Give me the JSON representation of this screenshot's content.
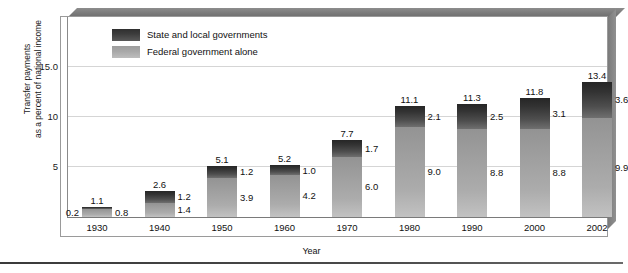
{
  "chart_data": {
    "type": "bar",
    "subtype": "stacked-bar",
    "title": "",
    "xlabel": "Year",
    "ylabel": "Transfer payments as a percent of national income",
    "ylabel_line1": "Transfer payments",
    "ylabel_line2": "as a percent of national income",
    "ylim": [
      0,
      17
    ],
    "yticks": [
      "5",
      "10",
      "15.0"
    ],
    "ytick_values": [
      5,
      10,
      15
    ],
    "grid": true,
    "legend_position": "top-left-inside",
    "categories": [
      "1930",
      "1940",
      "1950",
      "1960",
      "1970",
      "1980",
      "1990",
      "2000",
      "2002"
    ],
    "series": [
      {
        "name": "Federal government alone",
        "color": "#a8a8a8",
        "values": [
          0.8,
          1.4,
          3.9,
          4.2,
          6.0,
          9.0,
          8.8,
          8.8,
          9.9
        ]
      },
      {
        "name": "State and local governments",
        "color": "#3c3c3c",
        "values": [
          0.2,
          1.2,
          1.2,
          1.0,
          1.7,
          2.1,
          2.5,
          3.1,
          3.6
        ]
      }
    ],
    "totals": [
      "1.1",
      "2.6",
      "5.1",
      "5.2",
      "7.7",
      "11.1",
      "11.3",
      "11.8",
      "13.4"
    ],
    "total_values": [
      1.1,
      2.6,
      5.1,
      5.2,
      7.7,
      11.1,
      11.3,
      11.8,
      13.4
    ],
    "state_labels": [
      "0.2",
      "1.2",
      "1.2",
      "1.0",
      "1.7",
      "2.1",
      "2.5",
      "3.1",
      "3.6"
    ],
    "federal_labels": [
      "0.8",
      "1.4",
      "3.9",
      "4.2",
      "6.0",
      "9.0",
      "8.8",
      "8.8",
      "9.9"
    ],
    "state_label_side": [
      "left",
      "right",
      "right",
      "right",
      "right",
      "right",
      "right",
      "right",
      "right"
    ],
    "federal_label_side": [
      "right",
      "right",
      "right",
      "right",
      "right",
      "right",
      "right",
      "right",
      "right"
    ]
  },
  "legend": {
    "items": [
      {
        "label": "State and local governments",
        "swatch": "state"
      },
      {
        "label": "Federal government alone",
        "swatch": "federal"
      }
    ]
  },
  "axes": {
    "y_title_line1": "Transfer payments",
    "y_title_line2": "as a percent of national income",
    "x_title": "Year",
    "y_tick_15": "15.0",
    "y_tick_10": "10",
    "y_tick_5": "5"
  }
}
